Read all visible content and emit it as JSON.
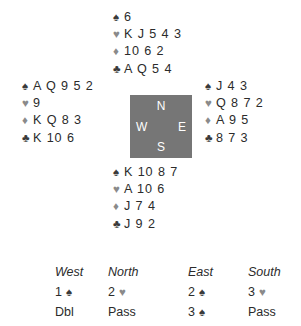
{
  "board": {
    "suit_glyphs": {
      "spade": "♠",
      "heart": "♥",
      "diamond": "♦",
      "club": "♣"
    },
    "hands": {
      "north": {
        "label": "North",
        "spades": "6",
        "hearts": "K J 5 4 3",
        "diamonds": "10 6 2",
        "clubs": "A Q 5 4"
      },
      "west": {
        "label": "West",
        "spades": "A Q 9 5 2",
        "hearts": "9",
        "diamonds": "K Q 8 3",
        "clubs": "K 10 6"
      },
      "east": {
        "label": "East",
        "spades": "J 4 3",
        "hearts": "Q 8 7 2",
        "diamonds": "A 9 5",
        "clubs": "8 7 3"
      },
      "south": {
        "label": "South",
        "spades": "K 10 8 7",
        "hearts": "A 10 6",
        "diamonds": "J 7 4",
        "clubs": "J 9 2"
      }
    },
    "compass": {
      "north": "N",
      "west": "W",
      "east": "E",
      "south": "S",
      "background_color": "#767676",
      "text_color": "#ffffff"
    },
    "auction": {
      "headers": [
        "West",
        "North",
        "East",
        "South"
      ],
      "rows": [
        [
          {
            "level": "1",
            "suit": "♠"
          },
          {
            "level": "2",
            "suit": "♥"
          },
          {
            "level": "2",
            "suit": "♠"
          },
          {
            "level": "3",
            "suit": "♥"
          }
        ],
        [
          {
            "level": "Dbl",
            "suit": ""
          },
          {
            "level": "Pass",
            "suit": ""
          },
          {
            "level": "3",
            "suit": "♠"
          },
          {
            "level": "Pass",
            "suit": ""
          }
        ]
      ]
    },
    "colors": {
      "background": "#ffffff",
      "text": "#2b2b2b",
      "pip_dark": "#3a3a3a",
      "pip_light": "#8a8a8a"
    }
  }
}
